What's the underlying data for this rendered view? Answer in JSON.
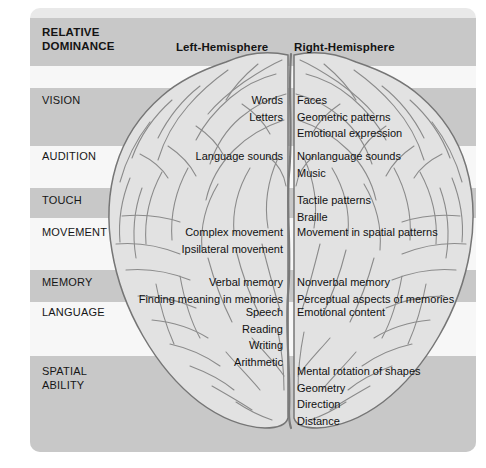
{
  "figure": {
    "title_line1": "RELATIVE",
    "title_line2": "DOMINANCE",
    "column_left": "Left-Hemisphere",
    "column_right": "Right-Hemisphere",
    "illustration": "brain-dorsal-view",
    "colors": {
      "panel_background": "#e9e9e9",
      "band_dark": "#c8c8c8",
      "band_light": "#ececec",
      "band_pale": "#f7f7f7",
      "text": "#141414",
      "brain_fill": "#e0e0e0",
      "brain_stroke": "#6f6f6f"
    }
  },
  "rows": [
    {
      "label": "VISION",
      "left": [
        "Words",
        "Letters"
      ],
      "right": [
        "Faces",
        "Geometric patterns",
        "Emotional expression"
      ]
    },
    {
      "label": "AUDITION",
      "left": [
        "Language sounds"
      ],
      "right": [
        "Nonlanguage sounds",
        "Music"
      ]
    },
    {
      "label": "TOUCH",
      "left": [],
      "right": [
        "Tactile patterns",
        "Braille"
      ]
    },
    {
      "label": "MOVEMENT",
      "left": [
        "Complex movement",
        "Ipsilateral movement"
      ],
      "right": [
        "Movement in spatial patterns"
      ]
    },
    {
      "label": "MEMORY",
      "left": [
        "Verbal memory",
        "Finding meaning in memories"
      ],
      "right": [
        "Nonverbal memory",
        "Perceptual aspects of memories"
      ]
    },
    {
      "label": "LANGUAGE",
      "left": [
        "Speech",
        "Reading",
        "Writing",
        "Arithmetic"
      ],
      "right": [
        "Emotional content"
      ]
    },
    {
      "label": "SPATIAL\nABILITY",
      "left": [],
      "right": [
        "Mental rotation of shapes",
        "Geometry",
        "Direction",
        "Distance"
      ]
    }
  ],
  "bands": [
    {
      "top": 10,
      "height": 48,
      "tone": "dark"
    },
    {
      "top": 58,
      "height": 22,
      "tone": "pale"
    },
    {
      "top": 80,
      "height": 58,
      "tone": "dark"
    },
    {
      "top": 138,
      "height": 42,
      "tone": "pale"
    },
    {
      "top": 180,
      "height": 30,
      "tone": "dark"
    },
    {
      "top": 210,
      "height": 52,
      "tone": "pale"
    },
    {
      "top": 262,
      "height": 32,
      "tone": "dark"
    },
    {
      "top": 294,
      "height": 54,
      "tone": "pale"
    },
    {
      "top": 348,
      "height": 96,
      "tone": "dark"
    }
  ],
  "layout": {
    "left_text_right_edge": 253,
    "right_text_left_edge": 267,
    "label_x": 12,
    "line_height": 16.5,
    "rows_y": {
      "header_title": 20,
      "header_cols": 36,
      "VISION": 86,
      "AUDITION": 142,
      "TOUCH": 186,
      "MOVEMENT": 218,
      "MEMORY": 268,
      "LANGUAGE": 298,
      "SPATIAL": 357
    }
  }
}
